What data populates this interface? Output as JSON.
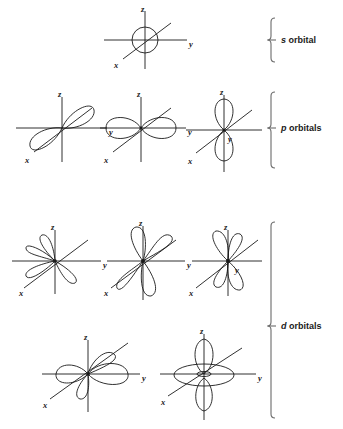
{
  "figure": {
    "background_color": "#ffffff",
    "line_color": "#1a1a1a",
    "bracket_color": "#6b6b6b",
    "axis_labels": {
      "x": "x",
      "y": "y",
      "z": "z"
    },
    "groups": [
      {
        "id": "s",
        "italic_letter": "s",
        "rest": " orbital",
        "label": "s orbital",
        "count": 1
      },
      {
        "id": "p",
        "italic_letter": "p",
        "rest": " orbitals",
        "label": "p orbitals",
        "count": 3
      },
      {
        "id": "d",
        "italic_letter": "d",
        "rest": " orbitals",
        "label": "d orbitals",
        "count": 5
      }
    ],
    "orbitals": [
      {
        "id": "s",
        "name": "s orbital",
        "row": 1,
        "shape": "sphere",
        "cx": 145,
        "cy": 40
      },
      {
        "id": "px",
        "name": "p-x orbital",
        "row": 2,
        "shape": "dumbbell",
        "cx": 62,
        "cy": 128,
        "axis": "x"
      },
      {
        "id": "py",
        "name": "p-y orbital",
        "row": 2,
        "shape": "dumbbell",
        "cx": 141,
        "cy": 128,
        "axis": "y"
      },
      {
        "id": "pz",
        "name": "p-z orbital",
        "row": 2,
        "shape": "dumbbell",
        "cx": 224,
        "cy": 130,
        "axis": "z"
      },
      {
        "id": "dxy",
        "name": "d-xy orbital",
        "row": 3,
        "shape": "four-lobe",
        "cx": 55,
        "cy": 261,
        "plane": "xy"
      },
      {
        "id": "dyz",
        "name": "d-yz orbital",
        "row": 3,
        "shape": "four-lobe",
        "cx": 143,
        "cy": 261,
        "plane": "yz"
      },
      {
        "id": "dxz",
        "name": "d-xz orbital",
        "row": 3,
        "shape": "four-lobe",
        "cx": 228,
        "cy": 261,
        "plane": "xz"
      },
      {
        "id": "dx2y2",
        "name": "d-x2-y2 orbital",
        "row": 4,
        "shape": "four-lobe",
        "cx": 88,
        "cy": 374,
        "plane": "x2y2"
      },
      {
        "id": "dz2",
        "name": "d-z2 orbital",
        "row": 4,
        "shape": "dz2-torus",
        "cx": 204,
        "cy": 374
      }
    ]
  }
}
